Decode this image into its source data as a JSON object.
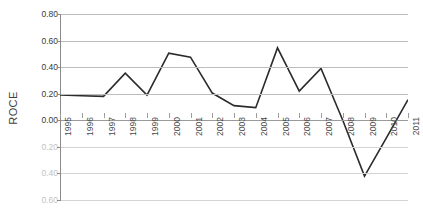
{
  "chart_data": {
    "type": "line",
    "title": "",
    "xlabel": "",
    "ylabel": "ROCE",
    "categories": [
      "1995",
      "1996",
      "1997",
      "1998",
      "1999",
      "2000",
      "2001",
      "2002",
      "2003",
      "2004",
      "2005",
      "2006",
      "2007",
      "2008",
      "2009",
      "2010",
      "2011"
    ],
    "values": [
      0.19,
      0.185,
      0.18,
      0.355,
      0.19,
      0.505,
      0.475,
      0.205,
      0.11,
      0.095,
      0.545,
      0.22,
      0.39,
      0.0,
      -0.42,
      -0.135,
      0.155
    ],
    "series": [
      {
        "name": "ROCE",
        "values": [
          0.19,
          0.185,
          0.18,
          0.355,
          0.19,
          0.505,
          0.475,
          0.205,
          0.11,
          0.095,
          0.545,
          0.22,
          0.39,
          0.0,
          -0.42,
          -0.135,
          0.155
        ]
      }
    ],
    "ylim": [
      -0.6,
      0.8
    ],
    "ytick_values": [
      0.8,
      0.6,
      0.4,
      0.2,
      0.0,
      -0.2,
      -0.4,
      -0.6
    ],
    "ytick_labels": [
      "0.80",
      "0.60",
      "0.40",
      "0.20",
      "0.00",
      "0.20",
      "0.40",
      "0.60"
    ],
    "grid": true,
    "legend": "none",
    "line_color": "#2b2b2b",
    "grid_color": "#bdbdbd",
    "faded_label_color": "#c2c2c2"
  },
  "axis": {
    "y_title": "ROCE"
  }
}
